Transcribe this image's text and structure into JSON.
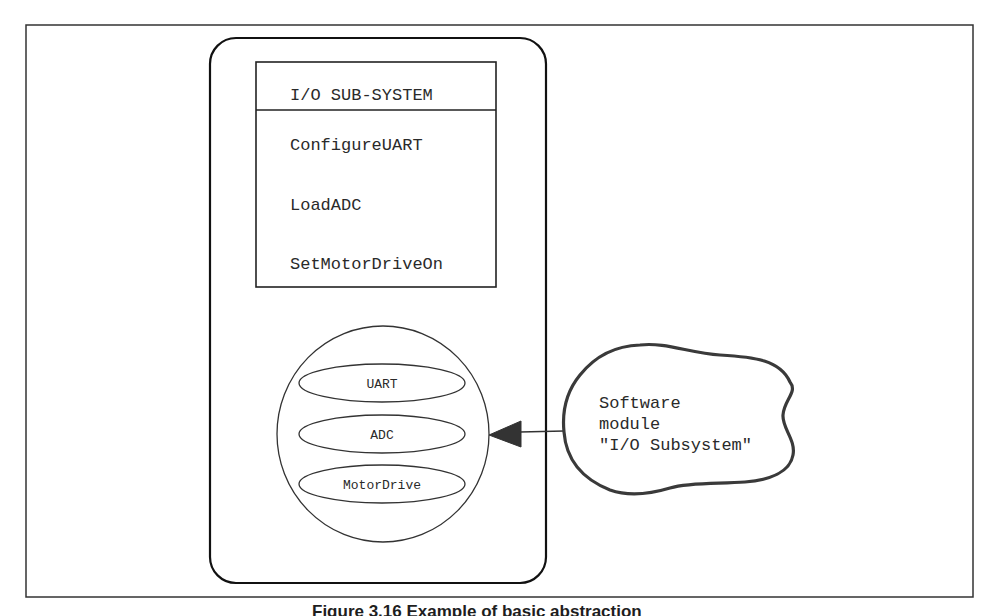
{
  "diagram": {
    "subsystem_box": {
      "title": "I/O SUB-SYSTEM",
      "operations": [
        "ConfigureUART",
        "LoadADC",
        "SetMotorDriveOn"
      ]
    },
    "module_circle": {
      "components": [
        "UART",
        "ADC",
        "MotorDrive"
      ]
    },
    "cloud_label": {
      "lines": [
        "Software",
        "module",
        "\"I/O Subsystem\""
      ]
    },
    "arrow": {
      "from": "cloud_label",
      "to": "module_circle"
    }
  },
  "caption": "Figure 3.16   Example of basic abstraction"
}
